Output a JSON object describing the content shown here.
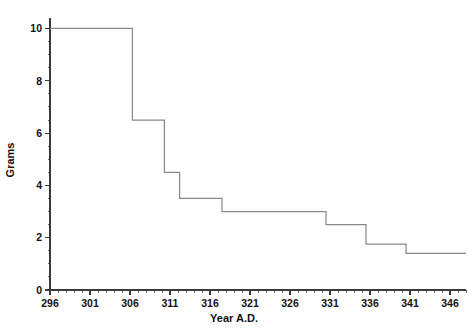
{
  "chart_data": {
    "type": "line",
    "subtype": "step",
    "title": "",
    "xlabel": "Year A.D.",
    "ylabel": "Grams",
    "xlim": [
      296,
      348
    ],
    "ylim": [
      0,
      10.4
    ],
    "grid": false,
    "legend": null,
    "x_ticks": [
      296,
      301,
      306,
      311,
      316,
      321,
      326,
      331,
      336,
      341,
      346
    ],
    "x_tick_labels": [
      "296",
      "301",
      "306",
      "311",
      "316",
      "321",
      "326",
      "331",
      "336",
      "341",
      "346"
    ],
    "x_minor_tick_step": 1,
    "y_ticks": [
      0,
      2,
      4,
      6,
      8,
      10
    ],
    "y_tick_labels": [
      "0",
      "2",
      "4",
      "6",
      "8",
      "10"
    ],
    "y_minor_tick_step": 0.5,
    "series": [
      {
        "name": "Coin weight",
        "color": "#8a8a8a",
        "steps": [
          {
            "x_start": 296.0,
            "x_end": 306.3,
            "y": 10.0
          },
          {
            "x_start": 306.3,
            "x_end": 310.3,
            "y": 6.5
          },
          {
            "x_start": 310.3,
            "x_end": 312.2,
            "y": 4.5
          },
          {
            "x_start": 312.2,
            "x_end": 317.5,
            "y": 3.5
          },
          {
            "x_start": 317.5,
            "x_end": 330.5,
            "y": 3.0
          },
          {
            "x_start": 330.5,
            "x_end": 335.5,
            "y": 2.5
          },
          {
            "x_start": 335.5,
            "x_end": 340.5,
            "y": 1.75
          },
          {
            "x_start": 340.5,
            "x_end": 348.0,
            "y": 1.4
          }
        ],
        "x": [
          296.0,
          306.3,
          306.3,
          310.3,
          310.3,
          312.2,
          312.2,
          317.5,
          317.5,
          330.5,
          330.5,
          335.5,
          335.5,
          340.5,
          340.5,
          348.0
        ],
        "y": [
          10.0,
          10.0,
          6.5,
          6.5,
          4.5,
          4.5,
          3.5,
          3.5,
          3.0,
          3.0,
          2.5,
          2.5,
          1.75,
          1.75,
          1.4,
          1.4
        ]
      }
    ]
  },
  "axes": {
    "x_title": "Year A.D.",
    "y_title": "Grams"
  },
  "colors": {
    "background": "#ffffff",
    "axis": "#3a3a3a",
    "data_line": "#8a8a8a",
    "text": "#121212"
  }
}
